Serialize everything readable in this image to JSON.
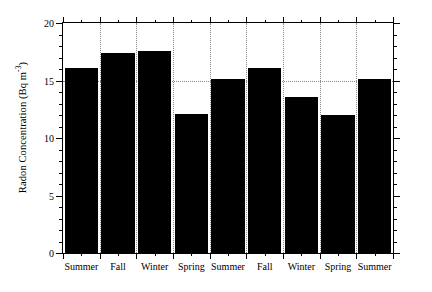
{
  "chart_data": {
    "type": "bar",
    "title": "",
    "xlabel": "",
    "ylabel": "Radon Concentration (Bq m",
    "ylabel_exponent": "-3",
    "ylabel_suffix": ")",
    "categories": [
      "Summer",
      "Fall",
      "Winter",
      "Spring",
      "Summer",
      "Fall",
      "Winter",
      "Spring",
      "Summer"
    ],
    "values": [
      16.1,
      17.4,
      17.6,
      12.1,
      15.1,
      16.1,
      13.6,
      12.0,
      15.1
    ],
    "ylim": [
      0,
      20
    ],
    "yticks": [
      0,
      5,
      10,
      15,
      20
    ],
    "ytick_labels": [
      "0",
      "5",
      "10",
      "15",
      "20"
    ],
    "y_minor_tick_step": 1,
    "grid": {
      "horizontal_dotted_at": [
        15
      ],
      "vertical_dotted_between_bars": true,
      "style": "dotted",
      "color": "#8a8a8a"
    },
    "bar_color": "#000000",
    "background_color": "#ffffff",
    "axis_color": "#000000",
    "legend": null,
    "legend_position": "none"
  }
}
